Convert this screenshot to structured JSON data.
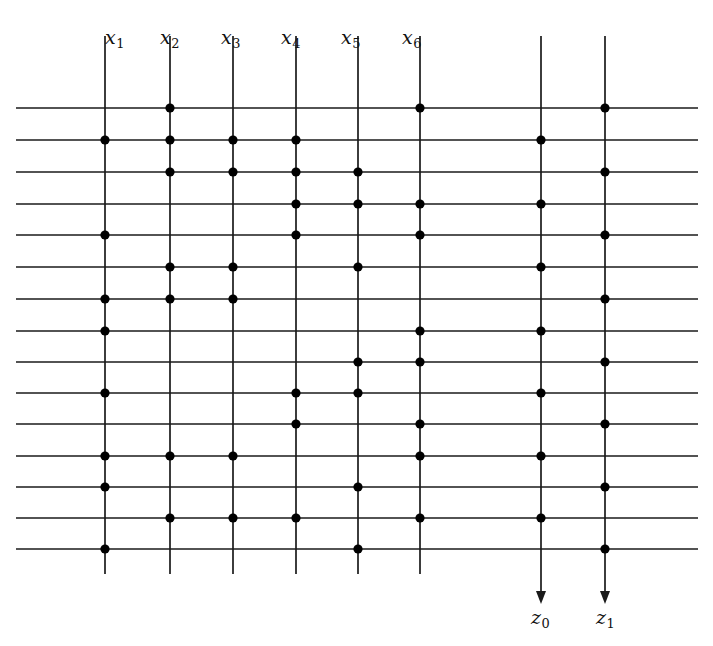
{
  "figure": {
    "background_color": "#ffffff",
    "line_color": "#1a1a1a",
    "dot_color": "#000000",
    "width": 713,
    "height": 646
  },
  "top_labels": [
    {
      "id": "x1",
      "base": "x",
      "sub": "1",
      "text": "x1",
      "x": 105,
      "y": 26
    },
    {
      "id": "x2",
      "base": "x",
      "sub": "2",
      "text": "x2",
      "x": 160,
      "y": 26
    },
    {
      "id": "x3",
      "base": "x",
      "sub": "3",
      "text": "x3",
      "x": 221,
      "y": 26
    },
    {
      "id": "x4",
      "base": "x",
      "sub": "4",
      "text": "x4",
      "x": 281,
      "y": 26
    },
    {
      "id": "x5",
      "base": "x",
      "sub": "5",
      "text": "x5",
      "x": 341,
      "y": 26
    },
    {
      "id": "x6",
      "base": "x",
      "sub": "6",
      "text": "x6",
      "x": 402,
      "y": 26
    }
  ],
  "bottom_labels": [
    {
      "id": "z0",
      "base": "z",
      "sub": "0",
      "text": "z0",
      "x": 531,
      "y": 606
    },
    {
      "id": "z1",
      "base": "z",
      "sub": "1",
      "text": "z1",
      "x": 596,
      "y": 606
    }
  ],
  "grid": {
    "vertical_line_count": 8,
    "horizontal_line_count": 15,
    "vertical_x": [
      105,
      170,
      233,
      296,
      358,
      420,
      541,
      605
    ],
    "vertical_top": 36,
    "vertical_bottom": 574,
    "horizontal_y": [
      108,
      140,
      172,
      204,
      235,
      267,
      299,
      331,
      362,
      393,
      424,
      456,
      487,
      518,
      549
    ],
    "horizontal_left": 16,
    "horizontal_right": 698,
    "arrow_columns": [
      541,
      605
    ],
    "arrow_top": 574,
    "arrow_bottom": 591
  },
  "columns": [
    {
      "name": "x1",
      "x": 105,
      "dot_rows": [
        2,
        5,
        7,
        8,
        10,
        12,
        13,
        15
      ]
    },
    {
      "name": "x2",
      "x": 170,
      "dot_rows": [
        1,
        2,
        3,
        6,
        7,
        12,
        14
      ]
    },
    {
      "name": "x3",
      "x": 233,
      "dot_rows": [
        2,
        3,
        6,
        7,
        12,
        14
      ]
    },
    {
      "name": "x4",
      "x": 296,
      "dot_rows": [
        2,
        3,
        4,
        5,
        10,
        11,
        14
      ]
    },
    {
      "name": "x5",
      "x": 358,
      "dot_rows": [
        3,
        4,
        6,
        9,
        10,
        13,
        15
      ]
    },
    {
      "name": "x6",
      "x": 420,
      "dot_rows": [
        1,
        4,
        5,
        8,
        9,
        11,
        12,
        14
      ]
    },
    {
      "name": "z0",
      "x": 541,
      "dot_rows": [
        2,
        4,
        6,
        8,
        10,
        12,
        14
      ]
    },
    {
      "name": "z1",
      "x": 605,
      "dot_rows": [
        1,
        3,
        5,
        7,
        9,
        11,
        13,
        15
      ]
    }
  ],
  "style": {
    "dot_radius": 4.6,
    "line_width": 1.7,
    "arrow_head_width": 10,
    "arrow_head_height": 13
  }
}
